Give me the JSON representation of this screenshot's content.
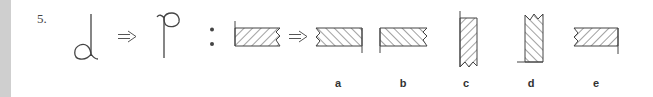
{
  "question": {
    "number": "5.",
    "premise": {
      "from_symbol": "loop-bottom-stem-up-icon",
      "to_symbol": "loop-top-stem-down-icon",
      "transform_glyph": "⇒",
      "separator": ":"
    },
    "problem": {
      "source_figure": "hatched-bar-left-line-up-zigzag-right",
      "transform_glyph": "⇒"
    },
    "options": [
      {
        "label": "a",
        "figure": "hatched-bar-zigzag-left-line-down-right"
      },
      {
        "label": "b",
        "figure": "hatched-bar-line-down-left-zigzag-right"
      },
      {
        "label": "c",
        "figure": "vertical-hatched-bar-line-up-left-zigzag-bottom"
      },
      {
        "label": "d",
        "figure": "vertical-hatched-bar-zigzag-top-baseline-left"
      },
      {
        "label": "e",
        "figure": "hatched-bar-zigzag-left-line-down-right"
      }
    ]
  },
  "colors": {
    "ink": "#444444",
    "side_strip": "#cfcfcf",
    "background": "#ffffff"
  }
}
